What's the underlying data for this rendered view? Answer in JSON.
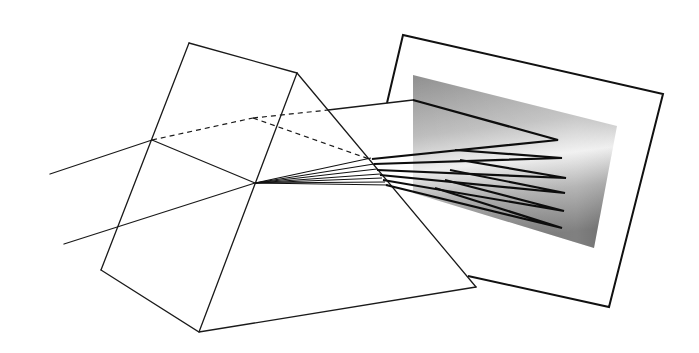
{
  "diagram": {
    "title": "Prism dispersing light onto a screen",
    "elements": {
      "prism": {
        "label": "triangular prism",
        "top_face": [
          [
            189,
            43
          ],
          [
            297,
            73
          ],
          [
            253,
            118
          ],
          [
            152,
            140
          ]
        ],
        "front_left_edge": [
          [
            189,
            43
          ],
          [
            101,
            270
          ]
        ],
        "front_right_edge": [
          [
            297,
            73
          ],
          [
            199,
            332
          ]
        ],
        "right_slant_edge": [
          [
            297,
            73
          ],
          [
            476,
            287
          ]
        ],
        "bottom_edges": [
          [
            [
              101,
              270
            ],
            [
              199,
              332
            ]
          ],
          [
            [
              199,
              332
            ],
            [
              476,
              287
            ]
          ]
        ]
      },
      "incident_rays": [
        {
          "from": [
            50,
            174
          ],
          "to": [
            152,
            140
          ]
        },
        {
          "from": [
            64,
            244
          ],
          "to": [
            255,
            183
          ]
        }
      ],
      "hidden_edges": [
        {
          "from": [
            152,
            140
          ],
          "to": [
            253,
            118
          ]
        },
        {
          "from": [
            253,
            118
          ],
          "to": [
            328,
            110
          ]
        },
        {
          "from": [
            253,
            118
          ],
          "to": [
            372,
            160
          ]
        }
      ],
      "dispersed_fan_origin": [
        255,
        183
      ],
      "dispersed_rays_count": 7,
      "screen": {
        "label": "projection screen",
        "corners": [
          [
            403,
            35
          ],
          [
            663,
            94
          ],
          [
            609,
            307
          ],
          [
            468,
            276
          ]
        ],
        "gradient_colors": [
          "#8a8a8a",
          "#e8e8e8",
          "#6e6e6e"
        ]
      },
      "spectrum_tips": [
        [
          558,
          140
        ],
        [
          562,
          158
        ],
        [
          566,
          178
        ],
        [
          565,
          193
        ],
        [
          564,
          211
        ],
        [
          562,
          228
        ]
      ]
    },
    "colors": {
      "line": "#111111",
      "background": "#ffffff",
      "spectrum_dark": "#6e6e6e",
      "spectrum_mid": "#9a9a9a",
      "spectrum_light": "#ececec"
    }
  }
}
